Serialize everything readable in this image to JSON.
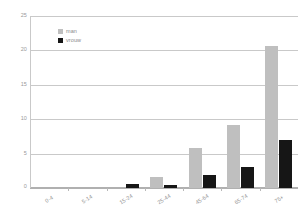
{
  "chart_data": {
    "type": "bar",
    "title": "",
    "xlabel": "",
    "ylabel": "",
    "ylim": [
      0,
      25
    ],
    "yticks": [
      0,
      5,
      10,
      15,
      20,
      25
    ],
    "ytick_labels": [
      "0",
      "5",
      "10",
      "15",
      "20",
      "25"
    ],
    "grid": true,
    "legend_position": "top-left",
    "categories": [
      "0-4",
      "5-14",
      "15-24",
      "25-44",
      "45-64",
      "65-74",
      "75+"
    ],
    "series": [
      {
        "name": "man",
        "color": "#bfbfbf",
        "values": [
          0,
          0,
          0,
          1.55,
          5.8,
          9.2,
          20.8
        ]
      },
      {
        "name": "vrouw",
        "color": "#161616",
        "values": [
          0,
          0,
          0.65,
          0.5,
          1.9,
          3.0,
          7.0
        ]
      }
    ]
  },
  "legend": {
    "items": [
      {
        "label": "man",
        "swatch_name": "legend-swatch-man"
      },
      {
        "label": "vrouw",
        "swatch_name": "legend-swatch-vrouw"
      }
    ]
  },
  "axes": {
    "y_tick_labels": [
      "25",
      "20",
      "15",
      "10",
      "5",
      "0"
    ],
    "x_tick_labels": [
      "0-4",
      "5-14",
      "15-24",
      "25-44",
      "45-64",
      "65-74",
      "75+"
    ]
  }
}
